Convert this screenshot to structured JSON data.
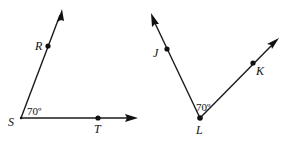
{
  "figures": [
    {
      "name": "angle-RST",
      "vertex": {
        "label": "S",
        "x": 21,
        "y": 118
      },
      "angle_label": "70º",
      "rays": [
        {
          "point_label": "R",
          "point": {
            "x": 48,
            "y": 46
          },
          "tip": {
            "x": 62,
            "y": 10
          }
        },
        {
          "point_label": "T",
          "point": {
            "x": 98,
            "y": 118
          },
          "tip": {
            "x": 137,
            "y": 118
          }
        }
      ]
    },
    {
      "name": "angle-JLK",
      "vertex": {
        "label": "L",
        "x": 200,
        "y": 118
      },
      "angle_label": "70º",
      "rays": [
        {
          "point_label": "J",
          "point": {
            "x": 167,
            "y": 49
          },
          "tip": {
            "x": 151,
            "y": 14
          }
        },
        {
          "point_label": "K",
          "point": {
            "x": 253,
            "y": 63
          },
          "tip": {
            "x": 279,
            "y": 38
          }
        }
      ]
    }
  ],
  "labels": {
    "S": "S",
    "R": "R",
    "T": "T",
    "J": "J",
    "K": "K",
    "L": "L",
    "angle1": "70º",
    "angle2": "70º"
  }
}
